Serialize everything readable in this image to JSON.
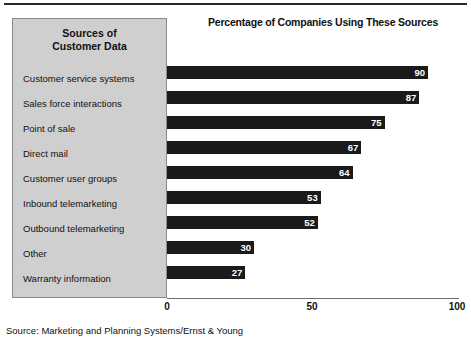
{
  "top_rule": "",
  "panel": {
    "header_line1": "Sources of",
    "header_line2": "Customer Data",
    "background_color": "#cfcfcf",
    "border_color": "#8a8a8a"
  },
  "source_note": "Source: Marketing and Planning Systems/Ernst & Young",
  "chart_data": {
    "type": "bar",
    "orientation": "horizontal",
    "title": "Percentage of Companies Using These Sources",
    "subtitle": "",
    "xlabel": "",
    "ylabel": "Sources of Customer Data",
    "xlim": [
      0,
      100
    ],
    "xticks": [
      0,
      50,
      100
    ],
    "xtick_labels": [
      "0",
      "50",
      "100"
    ],
    "grid": false,
    "legend": false,
    "bar_color": "#1a1a1a",
    "value_label_color": "#ffffff",
    "categories": [
      "Customer service systems",
      "Sales force interactions",
      "Point of sale",
      "Direct mail",
      "Customer user groups",
      "Inbound telemarketing",
      "Outbound telemarketing",
      "Other",
      "Warranty information"
    ],
    "values": [
      90,
      87,
      75,
      67,
      64,
      53,
      52,
      30,
      27
    ]
  }
}
